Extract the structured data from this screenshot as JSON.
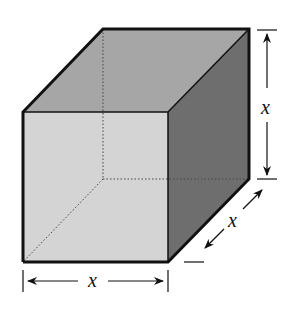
{
  "figure": {
    "type": "cube-with-dimensions",
    "labels": {
      "height": "x",
      "depth": "x",
      "width": "x"
    },
    "colors": {
      "front_face": "#d4d4d4",
      "top_face": "#a6a6a6",
      "right_face": "#6e6e6e",
      "edges": "#111111",
      "hidden_edges": "#444444"
    }
  }
}
